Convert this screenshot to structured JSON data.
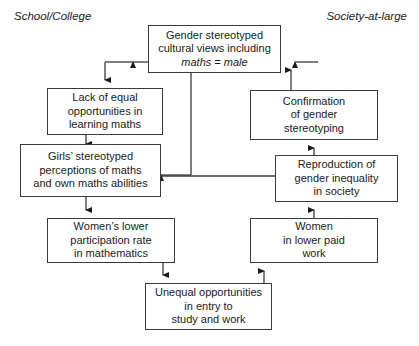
{
  "diagram": {
    "type": "flowchart",
    "captions": [
      {
        "id": "school-college",
        "label": "School/College"
      },
      {
        "id": "society-at-large",
        "label": "Society-at-large"
      }
    ],
    "nodes": [
      {
        "id": "gender-stereotyped-cultural-views",
        "line1": "Gender stereotyped",
        "line2": "cultural views including",
        "line3_italic": "maths = male"
      },
      {
        "id": "lack-of-equal-opportunities",
        "text": "Lack of equal\nopportunities in\nlearning maths"
      },
      {
        "id": "girls-stereotyped-perceptions",
        "text": "Girls’ stereotyped\nperceptions of maths\nand own maths abilities"
      },
      {
        "id": "womens-lower-participation",
        "text": "Women’s lower\nparticipation rate\nin mathematics"
      },
      {
        "id": "unequal-opportunities-entry",
        "text": "Unequal opportunities\nin entry to\nstudy and work"
      },
      {
        "id": "women-in-lower-paid-work",
        "text": "Women\nin lower paid\nwork"
      },
      {
        "id": "reproduction-of-gender-inequality",
        "text": "Reproduction of\ngender inequality\nin society"
      },
      {
        "id": "confirmation-of-gender-stereotyping",
        "text": "Confirmation\nof gender\nstereotyping"
      }
    ],
    "edges": [
      {
        "id": "edge-views-to-lack",
        "from": "gender-stereotyped-cultural-views",
        "to": "lack-of-equal-opportunities"
      },
      {
        "id": "edge-views-to-girls",
        "from": "gender-stereotyped-cultural-views",
        "to": "girls-stereotyped-perceptions"
      },
      {
        "id": "edge-lack-to-girls",
        "from": "lack-of-equal-opportunities",
        "to": "girls-stereotyped-perceptions"
      },
      {
        "id": "edge-girls-to-participation",
        "from": "girls-stereotyped-perceptions",
        "to": "womens-lower-participation"
      },
      {
        "id": "edge-participation-to-unequal",
        "from": "womens-lower-participation",
        "to": "unequal-opportunities-entry"
      },
      {
        "id": "edge-unequal-to-lowpaid",
        "from": "unequal-opportunities-entry",
        "to": "women-in-lower-paid-work"
      },
      {
        "id": "edge-lowpaid-to-reproduction",
        "from": "women-in-lower-paid-work",
        "to": "reproduction-of-gender-inequality"
      },
      {
        "id": "edge-reproduction-to-confirmation",
        "from": "reproduction-of-gender-inequality",
        "to": "confirmation-of-gender-stereotyping"
      },
      {
        "id": "edge-reproduction-to-girls",
        "from": "reproduction-of-gender-inequality",
        "to": "girls-stereotyped-perceptions"
      },
      {
        "id": "edge-confirmation-to-views",
        "from": "confirmation-of-gender-stereotyping",
        "to": "gender-stereotyped-cultural-views"
      }
    ],
    "colors": {
      "stroke": "#3a3a3a",
      "text": "#1a1a1a",
      "background": "#ffffff"
    }
  }
}
